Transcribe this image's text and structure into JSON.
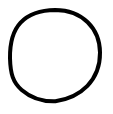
{
  "canvas": {
    "width": 113,
    "height": 114,
    "background_color": "#ffffff",
    "title": "Circle"
  },
  "figure": {
    "name": "circle-outline",
    "shape": "circle",
    "filled": false,
    "stroke_color": "#000000",
    "stroke_width": 4,
    "center_x": 55,
    "center_y": 55.5,
    "radius_x": 45,
    "radius_y": 45.5,
    "bounding_box": {
      "left": 8,
      "top": 8,
      "right": 102,
      "bottom": 103
    },
    "label": "circle"
  },
  "annotations": {
    "text_present": false,
    "items": []
  }
}
